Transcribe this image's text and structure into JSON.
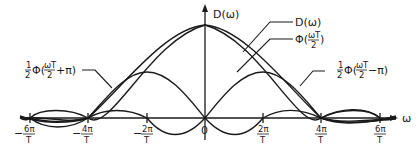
{
  "diagram": {
    "y_axis_label": "D(ω)",
    "x_axis_label": "ω",
    "origin_label": "0",
    "tick_labels": [
      {
        "num": "6π",
        "den": "T",
        "sign": "−"
      },
      {
        "num": "4π",
        "den": "T",
        "sign": "−"
      },
      {
        "num": "2π",
        "den": "T",
        "sign": "−"
      },
      {
        "num": "2π",
        "den": "T",
        "sign": ""
      },
      {
        "num": "4π",
        "den": "T",
        "sign": ""
      },
      {
        "num": "6π",
        "den": "T",
        "sign": ""
      }
    ],
    "curve_labels": {
      "d_omega": "D(ω)",
      "phi_center": {
        "prefix": "Φ(",
        "frac_num": "ωT",
        "frac_den": "2",
        "suffix": ")"
      },
      "phi_left": {
        "coef_num": "1",
        "coef_den": "2",
        "prefix": "Φ(",
        "frac_num": "ωT",
        "frac_den": "2",
        "suffix": "+π)"
      },
      "phi_right": {
        "coef_num": "1",
        "coef_den": "2",
        "prefix": "Φ(",
        "frac_num": "ωT",
        "frac_den": "2",
        "suffix": "−π)"
      }
    },
    "colors": {
      "ink": "#1a1a1a",
      "background": "#ffffff"
    }
  }
}
